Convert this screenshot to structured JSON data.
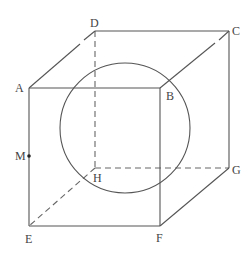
{
  "diagram": {
    "type": "cube-with-inscribed-circle",
    "vertices": {
      "A": {
        "label": "A",
        "x": 29,
        "y": 88
      },
      "B": {
        "label": "B",
        "x": 160,
        "y": 88
      },
      "C": {
        "label": "C",
        "x": 229,
        "y": 31
      },
      "D": {
        "label": "D",
        "x": 95,
        "y": 31
      },
      "E": {
        "label": "E",
        "x": 29,
        "y": 226
      },
      "F": {
        "label": "F",
        "x": 160,
        "y": 226
      },
      "G": {
        "label": "G",
        "x": 229,
        "y": 168
      },
      "H": {
        "label": "H",
        "x": 95,
        "y": 168
      }
    },
    "point_M": {
      "label": "M",
      "x": 29,
      "y": 156
    },
    "circle": {
      "cx": 125,
      "cy": 128,
      "r": 65
    },
    "visible_edges": [
      "AB",
      "BF",
      "FE",
      "EA",
      "DC",
      "CG",
      "GF",
      "AD",
      "BC"
    ],
    "hidden_edges": [
      "DH",
      "HE",
      "HG"
    ],
    "colors": {
      "line": "#555555",
      "text": "#444444"
    }
  }
}
